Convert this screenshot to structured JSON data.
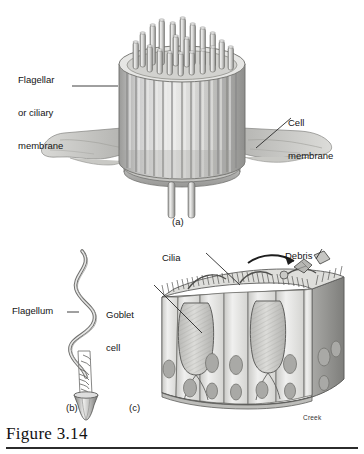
{
  "figure": {
    "caption": "Figure 3.14",
    "credit": "Creek"
  },
  "panels": [
    {
      "id": "a",
      "letter": "(a)",
      "subject": "cilium-cross-section"
    },
    {
      "id": "b",
      "letter": "(b)",
      "subject": "flagellum"
    },
    {
      "id": "c",
      "letter": "(c)",
      "subject": "ciliated-epithelium"
    }
  ],
  "labels": {
    "flagellar_membrane": "Flagellar\nor ciliary\nmembrane",
    "flagellar_membrane_lines": [
      "Flagellar",
      "or ciliary",
      "membrane"
    ],
    "cell_membrane": "Cell\nmembrane",
    "cell_membrane_lines": [
      "Cell",
      "membrane"
    ],
    "flagellum": "Flagellum",
    "cilia": "Cilia",
    "goblet_cell": "Goblet\ncell",
    "goblet_cell_lines": [
      "Goblet",
      "cell"
    ],
    "debris": "Debris"
  },
  "colors": {
    "ink": "#1b1b1b",
    "background": "#ffffff",
    "light_gray": "#e3e3e1",
    "mid_gray": "#bfbfbd",
    "dark_gray": "#8d8d8b",
    "shadow_gray": "#6a6a68",
    "outline": "#4a4a48"
  }
}
